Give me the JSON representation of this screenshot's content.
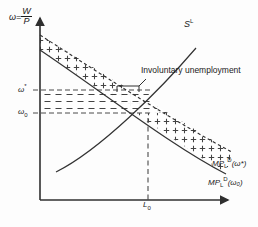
{
  "figure": {
    "background": "#fdfdfd",
    "line_color": "#333333",
    "axis_color": "#4a4a4a"
  },
  "axes": {
    "y_axis_label": {
      "variable": "ω",
      "equals": "=",
      "numerator": "W",
      "denominator": "P",
      "full": "ω = W/P"
    },
    "x_axis_label": "",
    "origin": {
      "x": 40,
      "y": 200
    },
    "y_top": {
      "x": 40,
      "y": 14
    },
    "x_right": {
      "x": 232,
      "y": 200
    }
  },
  "ticks": {
    "y": [
      {
        "name": "omega-star",
        "base": "ω",
        "super": "*",
        "sub": "",
        "value_y": 88
      },
      {
        "name": "omega-zero",
        "base": "ω",
        "super": "",
        "sub": "0",
        "value_y": 113
      }
    ],
    "x": [
      {
        "name": "L0",
        "base": "L",
        "sub": "0",
        "value_x": 148
      }
    ]
  },
  "curves": [
    {
      "name": "labour-supply",
      "label": "S",
      "label_super": "L",
      "style": "solid",
      "slope": "upward",
      "points": [
        [
          56,
          172
        ],
        [
          232,
          40
        ]
      ]
    },
    {
      "name": "labour-demand-omega-star",
      "label": "MP",
      "label_sub": "L",
      "label_super": "D",
      "label_arg": "(ω*)",
      "style": "dashed",
      "slope": "downward",
      "points": [
        [
          40,
          35
        ],
        [
          232,
          152
        ]
      ]
    },
    {
      "name": "labour-demand-omega-zero",
      "label": "MP",
      "label_sub": "L",
      "label_super": "D",
      "label_arg": "(ω₀)",
      "style": "solid",
      "slope": "downward",
      "points": [
        [
          40,
          50
        ],
        [
          226,
          174
        ]
      ]
    }
  ],
  "annotations": {
    "involuntary_unemployment": "Involuntary unemployment",
    "supply_curve_label": {
      "base": "S",
      "super": "L"
    },
    "demand_curve_label_1": {
      "base": "MP",
      "sub": "L",
      "super": "D",
      "arg": "(ω*)"
    },
    "demand_curve_label_2": {
      "base": "MP",
      "sub": "L",
      "super": "D",
      "arg": "(ω₀)"
    }
  },
  "regions": [
    {
      "name": "dotted-wedge",
      "fill_pattern": "plus-dots",
      "description": "Band between the two labour demand curves above the equilibrium"
    },
    {
      "name": "dashed-band",
      "fill_pattern": "horizontal-dashes",
      "description": "Band between omega-zero and omega-star wage levels"
    }
  ],
  "equilibrium": {
    "x": 148,
    "y": 120,
    "label": "L0"
  }
}
